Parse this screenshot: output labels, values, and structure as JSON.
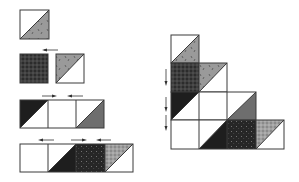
{
  "diagram": {
    "colors": {
      "outline": "#3a3a3a",
      "white": "#ffffff",
      "gray": "#9a9a9a",
      "dark": "#1e1e1e",
      "plaid_base": "#2c2c2c",
      "plaid_line": "#6a6a6a",
      "plaid_light_base": "#8a8a8a",
      "plaid_light_line": "#c8c8c8",
      "dotted_base": "#262626",
      "dotted_dot": "#8a8a8a",
      "arrow": "#333333"
    },
    "left_steps": [
      {
        "step": 1,
        "description": "Single half-square triangle unit: white / gray print"
      },
      {
        "step": 2,
        "description": "Dark plaid square joined to gray print HST",
        "arrows": [
          "left"
        ]
      },
      {
        "step": 3,
        "description": "Row of 3: black HST, white square, gray HST",
        "arrows": [
          "right",
          "left"
        ]
      },
      {
        "step": 4,
        "description": "Row of 4: white square, black HST, dotted dark square, light plaid HST",
        "arrows": [
          "left",
          "right",
          "left"
        ]
      }
    ],
    "right_assembly": {
      "description": "Staircase block, rows joined vertically",
      "rows": [
        [
          "hst-white-gray",
          null,
          null,
          null
        ],
        [
          "plaid-dark",
          "hst-gray-white",
          null,
          null
        ],
        [
          "hst-black-white",
          "white",
          "hst-white-gray",
          null
        ],
        [
          "white",
          "hst-white-black",
          "dotted-dark",
          "hst-plaid-white"
        ]
      ],
      "arrows": [
        "down",
        "down",
        "down"
      ]
    }
  }
}
